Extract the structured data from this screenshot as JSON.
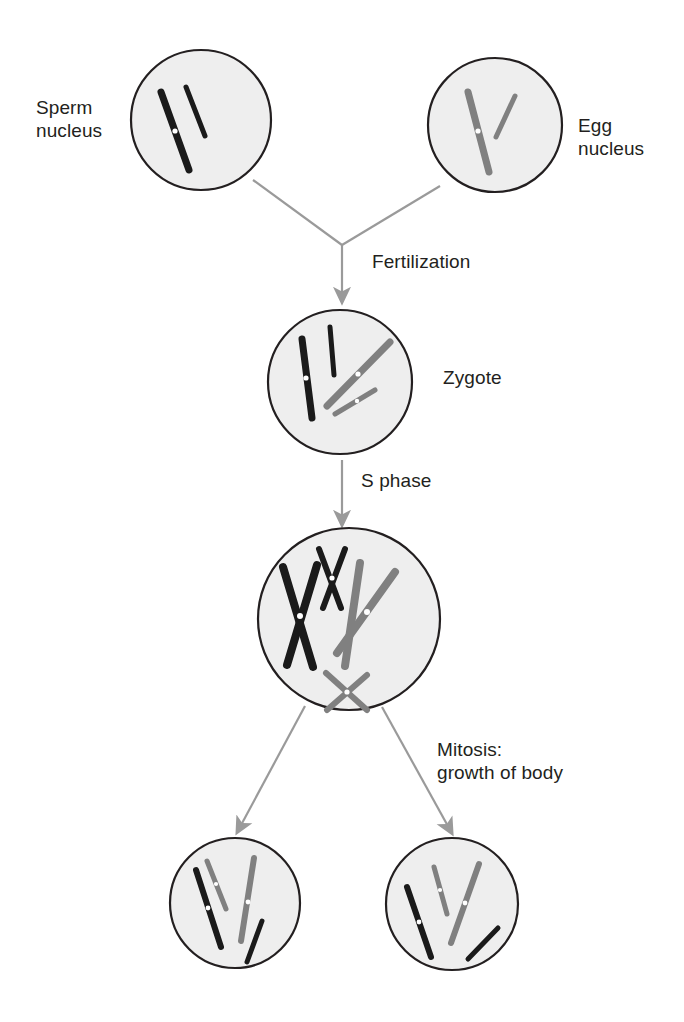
{
  "diagram": {
    "colors": {
      "paternal_chromosome": "#1a1a1a",
      "maternal_chromosome": "#808080",
      "cell_fill": "#eeeeee",
      "cell_outline": "#231f20",
      "arrow": "#9a9a9a",
      "text": "#231f20",
      "centromere": "#ffffff",
      "background": "#ffffff"
    },
    "labels": {
      "sperm_nucleus_line1": "Sperm",
      "sperm_nucleus_line2": "nucleus",
      "egg_nucleus_line1": "Egg",
      "egg_nucleus_line2": "nucleus",
      "fertilization": "Fertilization",
      "zygote": "Zygote",
      "s_phase": "S phase",
      "mitosis_line1": "Mitosis:",
      "mitosis_line2": "growth of body"
    },
    "stages": [
      {
        "id": "sperm-nucleus",
        "name": "Sperm nucleus",
        "label": "Sperm nucleus",
        "chromosome_count": 2,
        "chromosome_color": "#1a1a1a",
        "origin": "paternal",
        "replicated": false
      },
      {
        "id": "egg-nucleus",
        "name": "Egg nucleus",
        "label": "Egg nucleus",
        "chromosome_count": 2,
        "chromosome_color": "#808080",
        "origin": "maternal",
        "replicated": false
      },
      {
        "id": "zygote",
        "name": "Zygote",
        "label": "Zygote",
        "chromosome_count": 4,
        "chromosome_color": "mixed",
        "origin": "paternal and maternal",
        "replicated": false
      },
      {
        "id": "s-phase-cell",
        "name": "Cell after S phase",
        "label": "S phase",
        "chromosome_count": 4,
        "chromosome_color": "mixed",
        "origin": "paternal and maternal",
        "replicated": true
      },
      {
        "id": "daughter-cell-left",
        "name": "Left daughter cell",
        "label": "Mitosis: growth of body",
        "chromosome_count": 4,
        "chromosome_color": "mixed",
        "origin": "paternal and maternal",
        "replicated": false
      },
      {
        "id": "daughter-cell-right",
        "name": "Right daughter cell",
        "label": "Mitosis: growth of body",
        "chromosome_count": 4,
        "chromosome_color": "mixed",
        "origin": "paternal and maternal",
        "replicated": false
      }
    ],
    "transitions": [
      {
        "id": "fertilization",
        "label": "Fertilization",
        "from": [
          "sperm-nucleus",
          "egg-nucleus"
        ],
        "to": "zygote"
      },
      {
        "id": "s-phase",
        "label": "S phase",
        "from": [
          "zygote"
        ],
        "to": "s-phase-cell"
      },
      {
        "id": "mitosis",
        "label": "Mitosis: growth of body",
        "from": [
          "s-phase-cell"
        ],
        "to": [
          "daughter-cell-left",
          "daughter-cell-right"
        ]
      }
    ]
  }
}
